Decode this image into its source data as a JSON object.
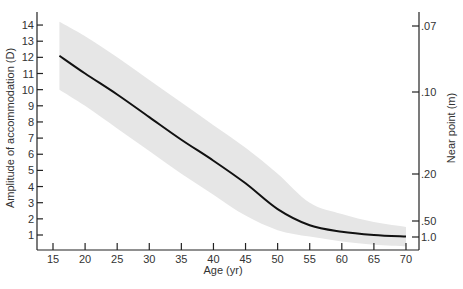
{
  "chart_data": {
    "type": "line",
    "title": "",
    "xlabel": "Age (yr)",
    "ylabel": "Amplitude of accommodation (D)",
    "y2label": "Near point (m)",
    "xlim": [
      13,
      72
    ],
    "ylim": [
      0,
      14.5
    ],
    "x_ticks": [
      15,
      20,
      25,
      30,
      35,
      40,
      45,
      50,
      55,
      60,
      65,
      70
    ],
    "y_ticks": [
      1,
      2,
      3,
      4,
      5,
      6,
      7,
      8,
      9,
      10,
      11,
      12,
      13,
      14
    ],
    "y2_ticks": [
      {
        "label": ".07",
        "diopters": 14.3
      },
      {
        "label": ".10",
        "diopters": 10
      },
      {
        "label": ".20",
        "diopters": 5
      },
      {
        "label": ".50",
        "diopters": 2
      },
      {
        "label": "1.0",
        "diopters": 1
      }
    ],
    "grid": false,
    "legend": null,
    "series": [
      {
        "name": "Mean amplitude",
        "x": [
          16,
          20,
          25,
          30,
          35,
          40,
          45,
          50,
          55,
          60,
          65,
          70
        ],
        "values": [
          12.1,
          11.0,
          9.7,
          8.3,
          6.9,
          5.6,
          4.2,
          2.6,
          1.6,
          1.2,
          1.0,
          0.9
        ]
      },
      {
        "name": "Range upper",
        "x": [
          16,
          20,
          25,
          30,
          35,
          40,
          45,
          50,
          55,
          60,
          65,
          70
        ],
        "values": [
          14.2,
          13.3,
          12.0,
          10.6,
          9.2,
          7.8,
          6.4,
          4.8,
          3.0,
          2.3,
          1.8,
          1.5
        ]
      },
      {
        "name": "Range lower",
        "x": [
          16,
          20,
          25,
          30,
          35,
          40,
          45,
          50,
          55,
          60,
          65,
          70
        ],
        "values": [
          10.0,
          9.0,
          7.6,
          6.2,
          4.8,
          3.5,
          2.2,
          1.3,
          0.9,
          0.6,
          0.4,
          0.3
        ]
      }
    ]
  }
}
